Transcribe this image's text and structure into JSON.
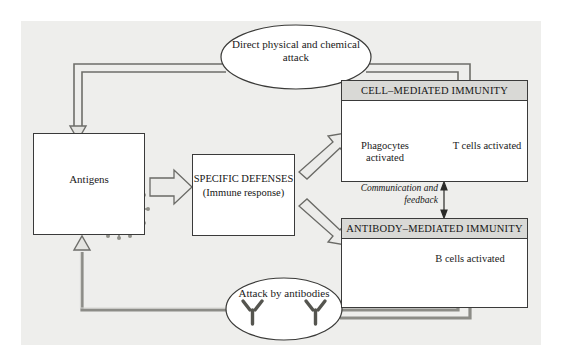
{
  "diagram": {
    "background_color": "#eeeeec",
    "boxes": {
      "antigens": {
        "label": "Antigens",
        "illustrations": [
          "rod-bacterium-icon",
          "bacteriophage-icon",
          "spherical-virus-icon"
        ]
      },
      "specific_defenses": {
        "line1": "SPECIFIC",
        "line2": "DEFENSES",
        "line3": "(Immune response)",
        "text": "SPECIFIC\nDEFENSES\n(Immune response)"
      },
      "cell_mediated": {
        "header": "CELL–MEDIATED IMMUNITY",
        "cells": [
          {
            "caption": "Phagocytes\nactivated",
            "icon": "phagocyte-cell-icon"
          },
          {
            "caption": "T cells\nactivated",
            "icon": "t-cell-icon"
          }
        ]
      },
      "antibody_mediated": {
        "header": "ANTIBODY–MEDIATED IMMUNITY",
        "cells": [
          {
            "caption": "B cells\nactivated",
            "icon": "b-cell-icon"
          }
        ]
      }
    },
    "ellipses": {
      "top": {
        "text": "Direct\nphysical and chemical\nattack"
      },
      "bottom": {
        "text": "Attack by\nantibodies",
        "icons": [
          "antibody-icon",
          "antibody-icon"
        ]
      }
    },
    "annotations": {
      "communication": "Communication\nand feedback"
    }
  }
}
